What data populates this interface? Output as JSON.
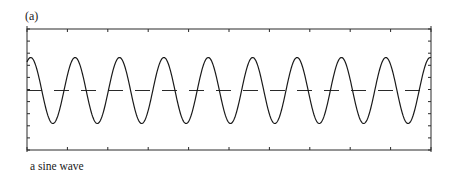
{
  "figure": {
    "panel_label": "(a)",
    "caption": "a sine wave"
  },
  "colors": {
    "ink": "#1a1a1a",
    "frame": "#2a2a2a",
    "background": "#ffffff"
  },
  "chart_data": {
    "type": "line",
    "title": "",
    "panel_label": "(a)",
    "caption": "a sine wave",
    "xlabel": "",
    "ylabel": "",
    "grid": false,
    "legend": null,
    "tick_labels": "none",
    "series": [
      {
        "name": "sine wave",
        "style": "solid",
        "function": "sin",
        "amplitude": 1.0,
        "cycles_visible": 9.1,
        "phase_at_left_edge_deg": 60
      },
      {
        "name": "zero line",
        "style": "dashed",
        "value": 0
      }
    ],
    "ylim": [
      -1.75,
      1.75
    ],
    "x_ticks_count": 11,
    "y_ticks_count": 11
  }
}
